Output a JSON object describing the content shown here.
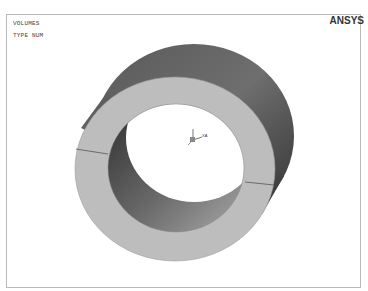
{
  "plot": {
    "title_line1": "VOLUMES",
    "title_line2": "TYPE NUM",
    "brand": "ANSYS",
    "triad_label": "XA",
    "object": "ring-volume",
    "colors": {
      "face": "#bdbdbd",
      "outer_side_light": "#8a8a8a",
      "outer_side_dark": "#3a3a3a",
      "inner_side_dark": "#3e3e3e",
      "inner_side_light": "#9a9a9a",
      "frame": "#b9b9b9"
    }
  }
}
